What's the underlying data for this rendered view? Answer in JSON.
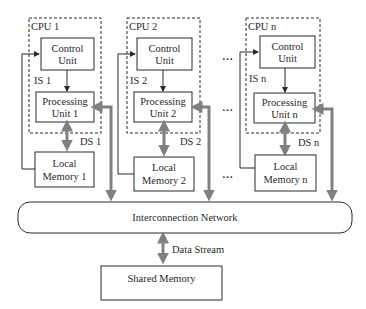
{
  "diagram": {
    "type": "MIMD distributed/shared memory architecture",
    "cpus": [
      {
        "label": "CPU 1",
        "control_unit": [
          "Control",
          "Unit"
        ],
        "processing_unit": [
          "Processing",
          "Unit 1"
        ],
        "local_memory": [
          "Local",
          "Memory 1"
        ],
        "instruction_stream": "IS 1",
        "data_stream": "DS 1"
      },
      {
        "label": "CPU 2",
        "control_unit": [
          "Control",
          "Unit"
        ],
        "processing_unit": [
          "Processing",
          "Unit 2"
        ],
        "local_memory": [
          "Local",
          "Memory 2"
        ],
        "instruction_stream": "IS 2",
        "data_stream": "DS 2"
      },
      {
        "label": "CPU n",
        "control_unit": [
          "Control",
          "Unit"
        ],
        "processing_unit": [
          "Processing",
          "Unit n"
        ],
        "local_memory": [
          "Local",
          "Memory n"
        ],
        "instruction_stream": "IS n",
        "data_stream": "DS n"
      }
    ],
    "ellipsis": "…",
    "network": "Interconnection Network",
    "data_stream": "Data Stream",
    "shared_memory": "Shared Memory",
    "colors": {
      "line": "#2a2a2a",
      "thick_arrow": "#808080",
      "background": "#ffffff"
    }
  }
}
